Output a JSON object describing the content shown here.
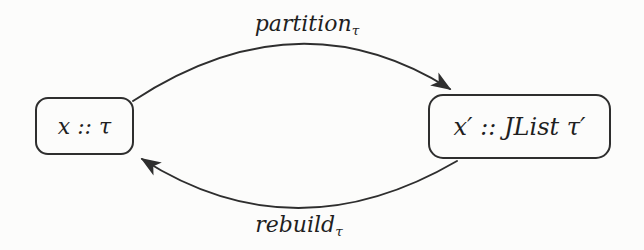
{
  "nodes": {
    "left": {
      "label": "x :: τ"
    },
    "right": {
      "label": "x′ :: JList τ′"
    }
  },
  "edges": {
    "partition": {
      "name": "partition",
      "subscript": "τ",
      "direction": "left-to-right"
    },
    "rebuild": {
      "name": "rebuild",
      "subscript": "τ",
      "direction": "right-to-left"
    }
  },
  "colors": {
    "stroke": "#2e2e2e",
    "text": "#1f1f1f",
    "background": "#fcfcfb"
  }
}
